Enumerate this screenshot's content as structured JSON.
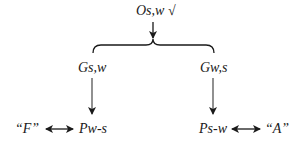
{
  "diagram": {
    "top_node": {
      "label": "Os,w",
      "mark": "√"
    },
    "left_branch": {
      "node": "Gs,w",
      "result": "Pw-s",
      "outcome": "“F”"
    },
    "right_branch": {
      "node": "Gw,s",
      "result": "Ps-w",
      "outcome": "“A”"
    }
  }
}
